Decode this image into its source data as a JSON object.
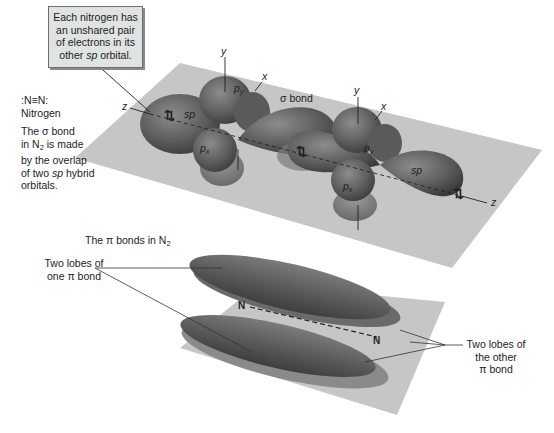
{
  "callout": {
    "lines": [
      "Each nitrogen has",
      "an unshared pair",
      "of electrons in its",
      "other"
    ],
    "orbital_word": "sp",
    "orbital_suffix": " orbital."
  },
  "left_panel": {
    "formula": ":N≡N:",
    "name": "Nitrogen",
    "sigma_caption": {
      "l1": "The σ bond",
      "l2_pre": "in N",
      "l2_sub": "2",
      "l2_post": " is made",
      "l3": "by the overlap",
      "l4_pre": "of two ",
      "l4_it": "sp",
      "l4_post": " hybrid",
      "l5": "orbitals."
    }
  },
  "sigma_diagram": {
    "sigma_label": "σ bond",
    "left_atom": {
      "y": "y",
      "x": "x",
      "z": "z",
      "py": "p",
      "py_sub": "y",
      "px": "p",
      "px_sub": "x",
      "sp": "sp"
    },
    "right_atom": {
      "y": "y",
      "x": "x",
      "z": "z",
      "py": "p",
      "py_sub": "y",
      "px": "p",
      "px_sub": "x",
      "sp": "sp"
    },
    "electron_pair": "⇅"
  },
  "pi_section": {
    "title_pre": "The π bonds in N",
    "title_sub": "2",
    "left_label_l1": "Two lobes of",
    "left_label_l2": "one π bond",
    "right_label_l1": "Two lobes of",
    "right_label_l2": "the other",
    "right_label_l3": "π bond",
    "atom_left": "N",
    "atom_right": "N"
  },
  "colors": {
    "plane": "#c4c4c4",
    "lobe_dark": "#555555",
    "lobe_mid": "#7a7a7a",
    "callout_bg": "#dfe3e1"
  }
}
